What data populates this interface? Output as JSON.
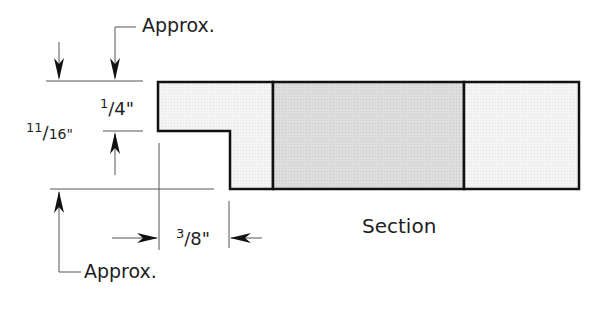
{
  "diagram": {
    "type": "cross-section profile drawing",
    "labels": {
      "approx_top": "Approx.",
      "approx_bottom": "Approx.",
      "dim_quarter": "1/4\"",
      "dim_quarter_num": "1",
      "dim_quarter_den": "4\"",
      "dim_eleven_sixteenths": "11/16\"",
      "dim_11_num": "11",
      "dim_11_den": "16\"",
      "dim_three_eighths": "3/8\"",
      "dim_38_num": "3",
      "dim_38_den": "8\"",
      "caption": "Section"
    },
    "dimensions": [
      {
        "label": "1/4\"",
        "orientation": "vertical",
        "note": "rabbet depth"
      },
      {
        "label": "11/16\"",
        "orientation": "vertical",
        "note": "overall thickness, approx."
      },
      {
        "label": "3/8\"",
        "orientation": "horizontal",
        "note": "rabbet width"
      }
    ],
    "regions": [
      {
        "name": "left-section",
        "fill": "#f3f3f3"
      },
      {
        "name": "center-section",
        "fill": "#dedede"
      },
      {
        "name": "right-section",
        "fill": "#f5f5f5"
      }
    ],
    "colors": {
      "outline": "#111111",
      "dim_line": "#444444",
      "light_fill": "#f3f3f3",
      "dark_fill": "#dcdcdc"
    }
  }
}
